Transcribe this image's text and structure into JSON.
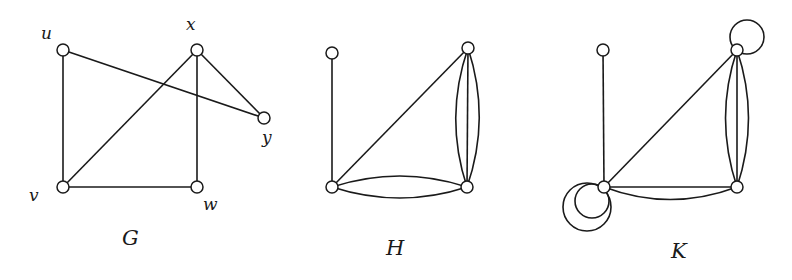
{
  "figure": {
    "graphs": [
      {
        "id": "G",
        "name": "G",
        "vertices": [
          {
            "id": "u",
            "label": "u"
          },
          {
            "id": "x",
            "label": "x"
          },
          {
            "id": "y",
            "label": "y"
          },
          {
            "id": "v",
            "label": "v"
          },
          {
            "id": "w",
            "label": "w"
          }
        ],
        "edges": [
          {
            "from": "u",
            "to": "v",
            "multiplicity": 1
          },
          {
            "from": "u",
            "to": "y",
            "multiplicity": 1
          },
          {
            "from": "x",
            "to": "v",
            "multiplicity": 1
          },
          {
            "from": "x",
            "to": "w",
            "multiplicity": 1
          },
          {
            "from": "x",
            "to": "y",
            "multiplicity": 1
          },
          {
            "from": "v",
            "to": "w",
            "multiplicity": 1
          }
        ],
        "loops": []
      },
      {
        "id": "H",
        "name": "H",
        "vertices": [
          {
            "id": "a",
            "label": ""
          },
          {
            "id": "b",
            "label": ""
          },
          {
            "id": "c",
            "label": ""
          },
          {
            "id": "d",
            "label": ""
          }
        ],
        "edges": [
          {
            "from": "a",
            "to": "c",
            "multiplicity": 1
          },
          {
            "from": "c",
            "to": "b",
            "multiplicity": 1
          },
          {
            "from": "b",
            "to": "d",
            "multiplicity": 3
          },
          {
            "from": "c",
            "to": "d",
            "multiplicity": 2
          }
        ],
        "loops": []
      },
      {
        "id": "K",
        "name": "K",
        "vertices": [
          {
            "id": "a",
            "label": ""
          },
          {
            "id": "b",
            "label": ""
          },
          {
            "id": "c",
            "label": ""
          },
          {
            "id": "d",
            "label": ""
          }
        ],
        "edges": [
          {
            "from": "a",
            "to": "c",
            "multiplicity": 1
          },
          {
            "from": "c",
            "to": "b",
            "multiplicity": 1
          },
          {
            "from": "b",
            "to": "d",
            "multiplicity": 3
          },
          {
            "from": "c",
            "to": "d",
            "multiplicity": 2
          }
        ],
        "loops": [
          {
            "at": "b",
            "count": 1
          },
          {
            "at": "c",
            "count": 2
          }
        ]
      }
    ]
  }
}
